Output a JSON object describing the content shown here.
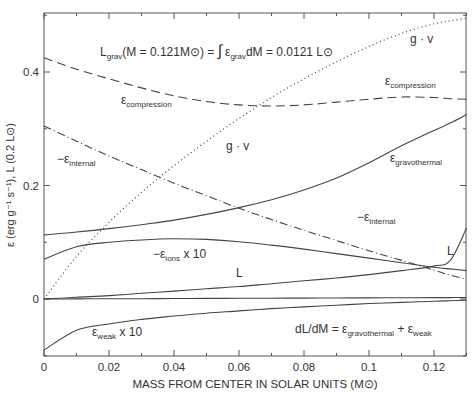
{
  "chart_data": {
    "type": "line",
    "title": "",
    "xlabel": "MASS FROM CENTER IN SOLAR UNITS (M⊙)",
    "ylabel": "ε (erg g⁻¹ s⁻¹), L (0.2 L⊙)",
    "xlim": [
      0,
      0.13
    ],
    "ylim": [
      -0.1,
      0.5
    ],
    "x_ticks": [
      0,
      0.02,
      0.04,
      0.06,
      0.08,
      0.1,
      0.12
    ],
    "x_tick_labels": [
      "0",
      "0.02",
      "0.04",
      "0.06",
      "0.08",
      "0.1",
      "0.12"
    ],
    "y_ticks": [
      0,
      0.2,
      0.4
    ],
    "y_tick_labels": [
      "0",
      "0.2",
      "0.4"
    ],
    "grid": false,
    "legend": "inline labels",
    "x": [
      0,
      0.01,
      0.02,
      0.03,
      0.04,
      0.05,
      0.06,
      0.07,
      0.08,
      0.09,
      0.1,
      0.11,
      0.12,
      0.125,
      0.13
    ],
    "series": [
      {
        "name": "εcompression",
        "style": "dashed",
        "values": [
          0.425,
          0.405,
          0.388,
          0.372,
          0.358,
          0.348,
          0.342,
          0.34,
          0.342,
          0.347,
          0.352,
          0.356,
          0.355,
          0.353,
          0.352
        ]
      },
      {
        "name": "g · v",
        "style": "dotted",
        "values": [
          0.0,
          0.075,
          0.135,
          0.188,
          0.235,
          0.278,
          0.318,
          0.355,
          0.388,
          0.418,
          0.445,
          0.468,
          0.485,
          0.49,
          0.495
        ]
      },
      {
        "name": "−εinternal",
        "style": "dashdot",
        "values": [
          0.305,
          0.278,
          0.252,
          0.228,
          0.204,
          0.182,
          0.16,
          0.14,
          0.121,
          0.103,
          0.085,
          0.068,
          0.051,
          0.042,
          0.035
        ]
      },
      {
        "name": "εgravothermal",
        "style": "solid",
        "values": [
          0.113,
          0.118,
          0.124,
          0.131,
          0.139,
          0.149,
          0.161,
          0.175,
          0.192,
          0.213,
          0.24,
          0.27,
          0.297,
          0.31,
          0.325
        ]
      },
      {
        "name": "−εions x 10",
        "style": "solid",
        "values": [
          0.07,
          0.092,
          0.1,
          0.104,
          0.106,
          0.105,
          0.101,
          0.095,
          0.088,
          0.08,
          0.072,
          0.064,
          0.056,
          0.053,
          0.05
        ]
      },
      {
        "name": "L",
        "style": "solid",
        "values": [
          0.0,
          0.003,
          0.006,
          0.01,
          0.014,
          0.018,
          0.022,
          0.027,
          0.032,
          0.037,
          0.043,
          0.05,
          0.058,
          0.068,
          0.125
        ]
      },
      {
        "name": "zero line",
        "style": "solid",
        "values": [
          0.0,
          0.0002,
          0.0004,
          0.0006,
          0.0008,
          0.001,
          0.0012,
          0.0014,
          0.0016,
          0.0018,
          0.002,
          0.0022,
          0.0024,
          0.0025,
          0.0026
        ]
      },
      {
        "name": "εweak x 10",
        "style": "solid",
        "values": [
          -0.09,
          -0.055,
          -0.044,
          -0.036,
          -0.03,
          -0.025,
          -0.021,
          -0.017,
          -0.014,
          -0.011,
          -0.008,
          -0.006,
          -0.004,
          -0.003,
          -0.002
        ]
      }
    ],
    "annotations": [
      {
        "id": "lgrav",
        "text": "Lgrav(M=0.121M⊙) = ∫ εgrav dM = 0.0121 L⊙"
      },
      {
        "id": "dldm",
        "text": "dL/dM = εgravothermal + εweak"
      }
    ]
  },
  "labels": {
    "ylabel": "ε (erg g⁻¹ s⁻¹), L (0.2 L⊙)",
    "xlabel": "MASS FROM CENTER IN SOLAR UNITS (M⊙)",
    "lgrav": {
      "pre": "L",
      "sub1": "grav",
      "mid": "(M = 0.121M⊙) = ",
      "integral": "∫",
      "eps": "ε",
      "sub2": "grav",
      "post": "dM = 0.0121 L⊙"
    },
    "dldm": {
      "pre": "dL/dM = ε",
      "sub1": "gravothermal",
      "mid": " + ε",
      "sub2": "weak"
    },
    "compression_left": {
      "eps": "ε",
      "sub": "compression"
    },
    "compression_right": {
      "eps": "ε",
      "sub": "compression"
    },
    "gv_top": "g · v",
    "gv_mid": "g · v",
    "internal_left": {
      "eps": "−ε",
      "sub": "internal"
    },
    "internal_right": {
      "eps": "−ε",
      "sub": "internal"
    },
    "gravothermal": {
      "eps": "ε",
      "sub": "gravothermal"
    },
    "ions": {
      "eps": "−ε",
      "sub": "ions",
      "post": " x 10"
    },
    "L_mid": "L",
    "L_right": "L",
    "weak": {
      "eps": "ε",
      "sub": "weak",
      "post": " x 10"
    }
  }
}
